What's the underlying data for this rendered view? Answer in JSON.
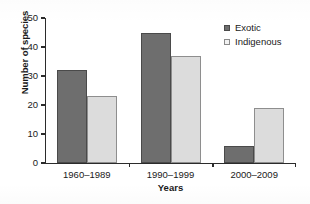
{
  "chart_data": {
    "type": "bar",
    "title": "",
    "xlabel": "Years",
    "ylabel": "Number of species",
    "categories": [
      "1960–1989",
      "1990–1999",
      "2000–2009"
    ],
    "series": [
      {
        "name": "Exotic",
        "values": [
          32,
          45,
          6
        ],
        "color": "#6e6e6e"
      },
      {
        "name": "Indigenous",
        "values": [
          23,
          37,
          19
        ],
        "color": "#dcdcdc"
      }
    ],
    "ylim": [
      0,
      50
    ],
    "yticks": [
      0,
      10,
      20,
      30,
      40,
      50
    ],
    "ytick_labels": [
      "0",
      "10",
      "20",
      "30",
      "40",
      "50"
    ],
    "grid": false,
    "legend_position": "top-right"
  },
  "legend": {
    "entries": [
      {
        "label": "Exotic"
      },
      {
        "label": "Indigenous"
      }
    ]
  },
  "axes": {
    "y_title": "Number of species",
    "x_title": "Years"
  }
}
